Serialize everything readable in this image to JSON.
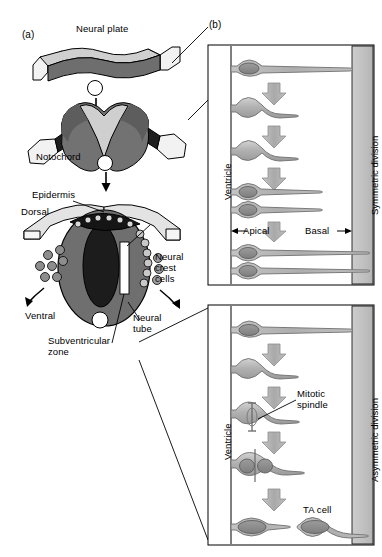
{
  "figure": {
    "panels": [
      {
        "id": "a",
        "letter": "(a)"
      },
      {
        "id": "b",
        "letter": "(b)"
      }
    ]
  },
  "panel_a": {
    "letter": "(a)",
    "labels": {
      "neural_plate": "Neural plate",
      "notochord": "Notochord",
      "epidermis": "Epidermis",
      "dorsal": "Dorsal",
      "ventral": "Ventral",
      "neural_crest_cells": "Neural\ncrest\ncells",
      "neural_crest_line1": "Neural",
      "neural_crest_line2": "crest",
      "neural_crest_line3": "cells",
      "neural_tube_line1": "Neural",
      "neural_tube_line2": "tube",
      "subventricular_line1": "Subventricular",
      "subventricular_line2": "zone"
    }
  },
  "panel_b": {
    "letter": "(b)",
    "top": {
      "side_label": "Symmetric division",
      "ventricle_label": "Ventricle",
      "apical_label": "Apical",
      "basal_label": "Basal",
      "stages": [
        {
          "name": "progenitor-single",
          "cells": 1
        },
        {
          "name": "progenitor-rounded",
          "cells": 1
        },
        {
          "name": "progenitor-rounded-2",
          "cells": 1
        },
        {
          "name": "daughters-two",
          "cells": 2
        },
        {
          "name": "daughters-two-final",
          "cells": 2
        }
      ],
      "arrow_count": 3
    },
    "bottom": {
      "side_label": "Asymmetric division",
      "ventricle_label": "Ventricle",
      "mitotic_spindle_line1": "Mitotic",
      "mitotic_spindle_line2": "spindle",
      "ta_cell_label": "TA cell",
      "stages": [
        {
          "name": "progenitor-single",
          "cells": 1
        },
        {
          "name": "progenitor-rounded",
          "cells": 1
        },
        {
          "name": "progenitor-with-spindle",
          "cells": 1
        },
        {
          "name": "two-nuclei-dividing",
          "cells": 2
        },
        {
          "name": "progenitor-and-ta-cell",
          "cells": 2
        }
      ],
      "arrow_count": 3
    }
  },
  "colors": {
    "dark_grey": "#5c5c5c",
    "mid_grey": "#8f8f8f",
    "light_grey": "#c9c9c9",
    "pale_grey": "#e2e2e2",
    "near_black": "#1a1a1a",
    "white": "#ffffff",
    "outline": "#000000",
    "cell_fill": "#b4b4b4",
    "nucleus_fill": "#8a8a8a",
    "arrow_fill": "#b0b0b0",
    "side_bar": "#c2c2c2"
  }
}
